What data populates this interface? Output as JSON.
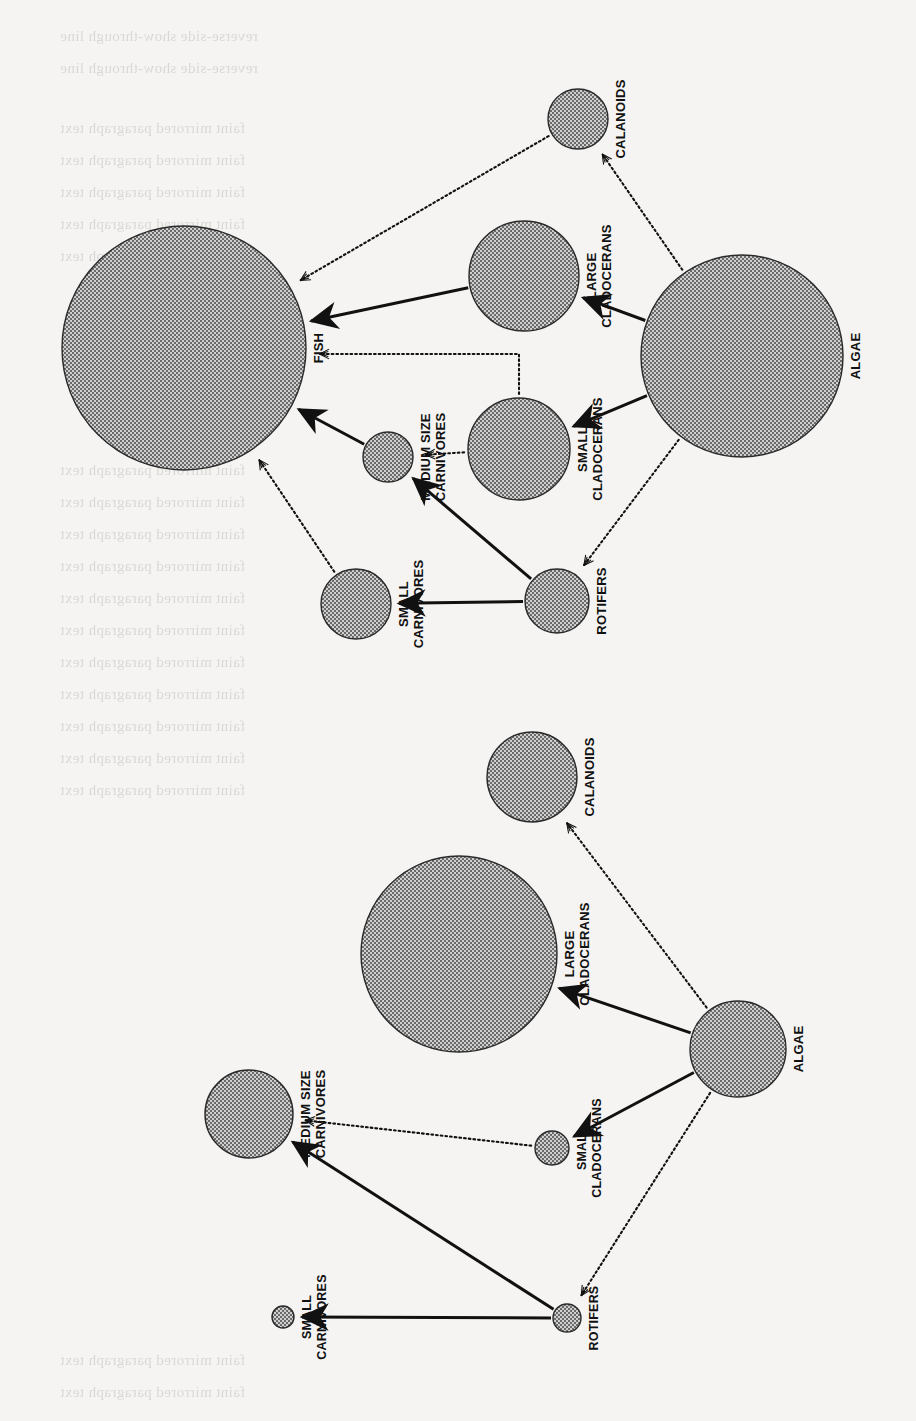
{
  "page": {
    "kind": "scanned-book-figure",
    "orientation": "rotated-90-clockwise",
    "background_color": "#f5f4f2",
    "ink_color": "#111111",
    "node_fill": "#9d9d9d",
    "node_stroke": "#2a2a2a"
  },
  "legend": {
    "solid_arrow_meaning": "strong interaction / direct consumption",
    "dotted_arrow_meaning": "weak or indirect interaction"
  },
  "chart_data": {
    "type": "diagram",
    "subtype": "food-web-bubble-network",
    "title": "",
    "panels": [
      {
        "id": "panel-top",
        "name": "Food web with fish",
        "nodes": [
          {
            "id": "fish",
            "label": "FISH",
            "cx": 184,
            "cy": 348,
            "r": 122
          },
          {
            "id": "calanoids",
            "label": "CALANOIDS",
            "cx": 578,
            "cy": 119,
            "r": 30
          },
          {
            "id": "largeclad",
            "label": "LARGE\nCLADOCERANS",
            "cx": 524,
            "cy": 276,
            "r": 55
          },
          {
            "id": "algae",
            "label": "ALGAE",
            "cx": 742,
            "cy": 356,
            "r": 101
          },
          {
            "id": "smallclad",
            "label": "SMALL\nCLADOCERANS",
            "cx": 519,
            "cy": 449,
            "r": 51
          },
          {
            "id": "medcarn",
            "label": "MEDIUM SIZE\nCARNIVORES",
            "cx": 388,
            "cy": 457,
            "r": 25
          },
          {
            "id": "smallcarn",
            "label": "SMALL\nCARNIVORES",
            "cx": 356,
            "cy": 604,
            "r": 35
          },
          {
            "id": "rotifers",
            "label": "ROTIFERS",
            "cx": 557,
            "cy": 601,
            "r": 32
          }
        ],
        "edges": [
          {
            "from": "algae",
            "to": "largeclad",
            "style": "solid"
          },
          {
            "from": "algae",
            "to": "smallclad",
            "style": "solid"
          },
          {
            "from": "algae",
            "to": "calanoids",
            "style": "dotted"
          },
          {
            "from": "algae",
            "to": "rotifers",
            "style": "dotted"
          },
          {
            "from": "largeclad",
            "to": "fish",
            "style": "solid"
          },
          {
            "from": "calanoids",
            "to": "fish",
            "style": "dotted"
          },
          {
            "from": "smallclad",
            "to": "fish",
            "style": "dotted",
            "shape": "elbow"
          },
          {
            "from": "smallclad",
            "to": "medcarn",
            "style": "dotted"
          },
          {
            "from": "medcarn",
            "to": "fish",
            "style": "solid"
          },
          {
            "from": "rotifers",
            "to": "medcarn",
            "style": "solid"
          },
          {
            "from": "rotifers",
            "to": "smallcarn",
            "style": "solid"
          },
          {
            "from": "smallcarn",
            "to": "fish",
            "style": "dotted"
          }
        ]
      },
      {
        "id": "panel-bottom",
        "name": "Food web without fish",
        "nodes": [
          {
            "id": "calanoids2",
            "label": "CALANOIDS",
            "cx": 532,
            "cy": 777,
            "r": 45
          },
          {
            "id": "largeclad2",
            "label": "LARGE\nCLADOCERANS",
            "cx": 459,
            "cy": 954,
            "r": 98
          },
          {
            "id": "algae2",
            "label": "ALGAE",
            "cx": 738,
            "cy": 1049,
            "r": 48
          },
          {
            "id": "smallclad2",
            "label": "SMALL\nCLADOCERANS",
            "cx": 552,
            "cy": 1148,
            "r": 17
          },
          {
            "id": "medcarn2",
            "label": "MEDIUM SIZE\nCARNIVORES",
            "cx": 249,
            "cy": 1114,
            "r": 44
          },
          {
            "id": "smallcarn2",
            "label": "SMALL\nCARNIVORES",
            "cx": 283,
            "cy": 1317,
            "r": 11
          },
          {
            "id": "rotifers2",
            "label": "ROTIFERS",
            "cx": 567,
            "cy": 1318,
            "r": 14
          }
        ],
        "edges": [
          {
            "from": "algae2",
            "to": "largeclad2",
            "style": "solid"
          },
          {
            "from": "algae2",
            "to": "smallclad2",
            "style": "solid"
          },
          {
            "from": "algae2",
            "to": "calanoids2",
            "style": "dotted"
          },
          {
            "from": "algae2",
            "to": "rotifers2",
            "style": "dotted"
          },
          {
            "from": "smallclad2",
            "to": "medcarn2",
            "style": "dotted"
          },
          {
            "from": "rotifers2",
            "to": "medcarn2",
            "style": "solid"
          },
          {
            "from": "rotifers2",
            "to": "smallcarn2",
            "style": "solid"
          }
        ]
      }
    ],
    "labels": [
      "FISH",
      "CALANOIDS",
      "LARGE CLADOCERANS",
      "ALGAE",
      "SMALL CLADOCERANS",
      "MEDIUM SIZE CARNIVORES",
      "SMALL CARNIVORES",
      "ROTIFERS"
    ]
  },
  "bleed_through_text": [
    {
      "text": "reverse-side show-through line",
      "x": 60,
      "y": 28,
      "size": 15
    },
    {
      "text": "reverse-side show-through line",
      "x": 60,
      "y": 60,
      "size": 15
    },
    {
      "text": "faint mirrored paragraph text",
      "x": 60,
      "y": 120,
      "size": 15
    },
    {
      "text": "faint mirrored paragraph text",
      "x": 60,
      "y": 152,
      "size": 15
    },
    {
      "text": "faint mirrored paragraph text",
      "x": 60,
      "y": 184,
      "size": 15
    },
    {
      "text": "faint mirrored paragraph text",
      "x": 60,
      "y": 216,
      "size": 15
    },
    {
      "text": "faint mirrored paragraph text",
      "x": 60,
      "y": 248,
      "size": 15
    },
    {
      "text": "faint mirrored paragraph text",
      "x": 60,
      "y": 462,
      "size": 15
    },
    {
      "text": "faint mirrored paragraph text",
      "x": 60,
      "y": 494,
      "size": 15
    },
    {
      "text": "faint mirrored paragraph text",
      "x": 60,
      "y": 526,
      "size": 15
    },
    {
      "text": "faint mirrored paragraph text",
      "x": 60,
      "y": 558,
      "size": 15
    },
    {
      "text": "faint mirrored paragraph text",
      "x": 60,
      "y": 590,
      "size": 15
    },
    {
      "text": "faint mirrored paragraph text",
      "x": 60,
      "y": 622,
      "size": 15
    },
    {
      "text": "faint mirrored paragraph text",
      "x": 60,
      "y": 654,
      "size": 15
    },
    {
      "text": "faint mirrored paragraph text",
      "x": 60,
      "y": 686,
      "size": 15
    },
    {
      "text": "faint mirrored paragraph text",
      "x": 60,
      "y": 718,
      "size": 15
    },
    {
      "text": "faint mirrored paragraph text",
      "x": 60,
      "y": 750,
      "size": 15
    },
    {
      "text": "faint mirrored paragraph text",
      "x": 60,
      "y": 782,
      "size": 15
    },
    {
      "text": "faint mirrored paragraph text",
      "x": 60,
      "y": 1352,
      "size": 15
    },
    {
      "text": "faint mirrored paragraph text",
      "x": 60,
      "y": 1384,
      "size": 15
    }
  ]
}
